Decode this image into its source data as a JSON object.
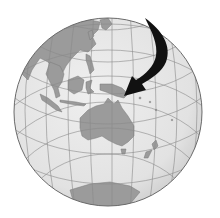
{
  "image": {
    "subject": "Globe centered on Australia and the western Pacific",
    "caption": "",
    "width": 220,
    "height": 218
  },
  "globe": {
    "center": [
      108,
      112
    ],
    "radius": 94,
    "ocean_color": "#e4e4e4",
    "land_color": "#9a9a9a",
    "grid_color": "#8a8a8a",
    "outline_color": "#6a6a6a",
    "visible_regions": [
      "East Asia",
      "Southeast Asia",
      "Indonesia",
      "New Guinea",
      "Australia",
      "New Zealand",
      "Antarctica"
    ]
  },
  "arrow": {
    "color": "#111111",
    "points_to": "New Guinea",
    "start": [
      147,
      18
    ],
    "tip": [
      124,
      96
    ]
  }
}
